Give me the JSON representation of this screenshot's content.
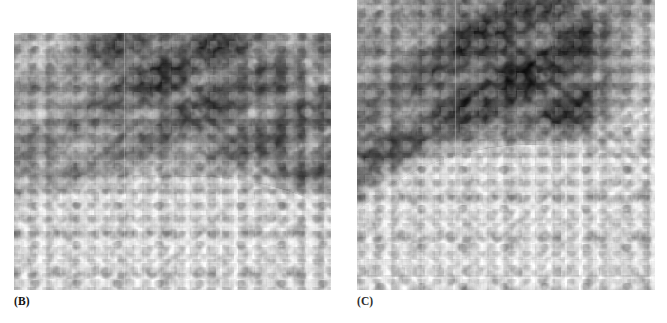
{
  "figure": {
    "kind": "radiograph-figure",
    "background_color": "#ffffff",
    "panel_count": 2,
    "clipped_caption_text": ""
  },
  "panels": [
    {
      "id": "b",
      "label": "(B)",
      "modality": "chest-radiograph",
      "description": "Close-up grayscale chest radiograph showing diagonal rib bands, a dark lung field in the upper right, and a bright diaphragm dome across the lower left",
      "bounds": {
        "x": 14,
        "y": 33,
        "width": 317,
        "height": 257
      },
      "label_position": {
        "x": 14,
        "y": 296
      },
      "label_bold": true,
      "tones": {
        "darkest": "#1d1d1d",
        "mid": "#8e8e8e",
        "lightest": "#ffffff"
      },
      "artifacts": {
        "vertical_scan_line_x": 124,
        "halftone_grid": true
      }
    },
    {
      "id": "c",
      "label": "(C)",
      "modality": "chest-radiograph",
      "description": "Close-up grayscale chest radiograph, flush with the top edge, with a very dark lung field, a prominent curved diaphragm, and a bright lateral chest wall at the right",
      "bounds": {
        "x": 357,
        "y": 0,
        "width": 298,
        "height": 290
      },
      "label_position": {
        "x": 357,
        "y": 296
      },
      "label_bold": true,
      "tones": {
        "darkest": "#0e0e0e",
        "mid": "#7c7c7c",
        "lightest": "#ffffff"
      },
      "artifacts": {
        "vertical_scan_line_x": 455,
        "halftone_grid": true
      }
    }
  ]
}
